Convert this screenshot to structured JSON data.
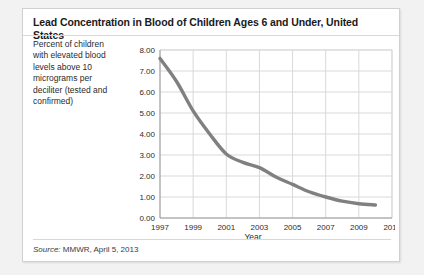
{
  "card": {
    "title": "Lead Concentration in Blood of Children Ages 6 and Under, United States",
    "y_axis_description": "Percent of children with elevated blood levels above 10 micrograms per deciliter (tested and confirmed)",
    "source_prefix": "Source:",
    "source_text": " MMWR, April 5, 2013"
  },
  "colors": {
    "line": "#808080",
    "grid": "#d9d9d9",
    "axis": "#9a9a9a",
    "card_background": "#ffffff",
    "page_background": "#f2f2f2",
    "text": "#2b2b2b"
  },
  "chart_data": {
    "type": "line",
    "title": "Lead Concentration in Blood of Children Ages 6 and Under, United States",
    "xlabel": "Year",
    "ylabel": "Percent of children with elevated blood levels above 10 micrograms per deciliter (tested and confirmed)",
    "xlim": [
      1997,
      2011
    ],
    "ylim": [
      0.0,
      8.0
    ],
    "grid": true,
    "legend": "none",
    "x_ticks": [
      "1997",
      "1999",
      "2001",
      "2003",
      "2005",
      "2007",
      "2009",
      "2011"
    ],
    "x_tick_values": [
      1997,
      1999,
      2001,
      2003,
      2005,
      2007,
      2009,
      2011
    ],
    "y_ticks": [
      "0.00",
      "1.00",
      "2.00",
      "3.00",
      "4.00",
      "5.00",
      "6.00",
      "7.00",
      "8.00"
    ],
    "y_tick_values": [
      0,
      1,
      2,
      3,
      4,
      5,
      6,
      7,
      8
    ],
    "x": [
      1997,
      1998,
      1999,
      2000,
      2001,
      2002,
      2003,
      2004,
      2005,
      2006,
      2007,
      2008,
      2009,
      2010
    ],
    "series": [
      {
        "name": "Percent of children with elevated blood lead levels",
        "values": [
          7.6,
          6.5,
          5.1,
          4.0,
          3.05,
          2.65,
          2.4,
          1.95,
          1.6,
          1.25,
          1.0,
          0.8,
          0.68,
          0.62
        ]
      }
    ]
  }
}
